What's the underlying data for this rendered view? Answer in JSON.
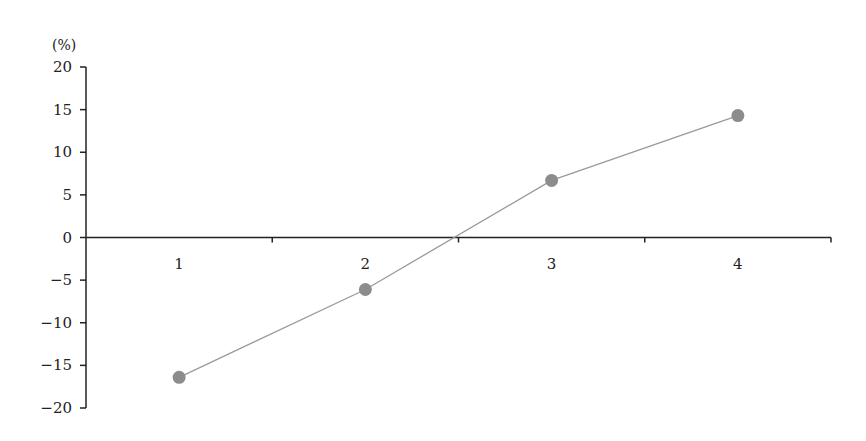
{
  "chart_data": {
    "type": "line",
    "title": "",
    "xlabel": "",
    "ylabel": "(%)",
    "categories": [
      "1",
      "2",
      "3",
      "4"
    ],
    "series": [
      {
        "name": "",
        "values": [
          -16.4,
          -6.1,
          6.7,
          14.3
        ]
      }
    ],
    "ylim": [
      -20,
      20
    ],
    "yticks": [
      20,
      15,
      10,
      5,
      0,
      -5,
      -10,
      -15,
      -20
    ],
    "ytick_labels": [
      "20",
      "15",
      "10",
      "5",
      "0",
      "−5",
      "−10",
      "−15",
      "−20"
    ],
    "grid": false,
    "legend": "none",
    "colors": {
      "line": "#9a9a9a",
      "marker": "#8c8c8c",
      "axis": "#222222"
    }
  }
}
